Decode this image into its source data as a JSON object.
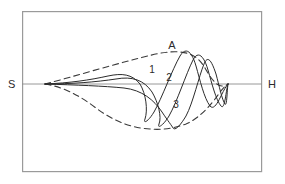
{
  "figure": {
    "title": "",
    "frame": {
      "x": 22,
      "y": 11,
      "width": 240,
      "height": 161,
      "stroke": "#9a9a9a",
      "stroke_width": 1.2
    },
    "baseline": {
      "y": 84,
      "x_start": 22,
      "x_end": 262,
      "stroke": "#8c8c8c",
      "stroke_width": 0.9
    },
    "colors": {
      "curve": "#2b2b2b",
      "envelope": "#3a3a3a",
      "axis": "#8c8c8c",
      "frame": "#9a9a9a",
      "background": "#ffffff",
      "text": "#2b2b2b"
    },
    "labels": {
      "left_axis": "S",
      "right_axis": "H",
      "apex": "A",
      "curve_1": "1",
      "curve_2": "2",
      "curve_3": "3"
    },
    "label_positions": {
      "left_axis": {
        "x": 8,
        "y": 88
      },
      "right_axis": {
        "x": 268,
        "y": 88
      },
      "apex": {
        "x": 172,
        "y": 49
      },
      "curve_1": {
        "x": 152,
        "y": 73
      },
      "curve_2": {
        "x": 169,
        "y": 81
      },
      "curve_3": {
        "x": 176,
        "y": 108
      }
    },
    "origin_point": {
      "x": 45,
      "y": 84
    },
    "convergence_point": {
      "x": 228,
      "y": 84
    },
    "envelope_upper_apex": {
      "x": 178,
      "y": 52
    },
    "envelope_lower_min": {
      "x": 168,
      "y": 129
    },
    "curves": [
      {
        "name": "curve-1",
        "label": "1",
        "dashed": false,
        "peak": {
          "x": 180,
          "y": 54
        },
        "trough": {
          "x": 143,
          "y": 119
        },
        "path": "M45,84 C70,83 90,80 108,76 C122,73 132,74 140,84 C146,94 148,110 145,119 C143,124 148,122 154,112 C162,98 172,70 180,56 C186,46 192,52 196,66 C200,80 204,98 210,106 C216,113 222,90 228,84"
      },
      {
        "name": "curve-2",
        "label": "2",
        "dashed": false,
        "peak": {
          "x": 192,
          "y": 58
        },
        "trough": {
          "x": 158,
          "y": 124
        },
        "path": "M45,84 C72,84 96,82 116,79 C132,76 144,80 152,92 C158,102 162,117 159,124 C157,129 163,126 169,116 C177,102 186,74 193,60 C198,50 204,56 208,70 C212,84 216,100 221,106 C225,111 226,89 228,84"
      },
      {
        "name": "curve-3",
        "label": "3",
        "dashed": false,
        "peak": {
          "x": 200,
          "y": 62
        },
        "trough": {
          "x": 172,
          "y": 128
        },
        "path": "M45,84 C76,85 104,86 124,88 C142,90 154,100 162,112 C168,121 172,126 173,128 C175,131 180,126 186,116 C193,103 199,76 204,64 C208,54 212,62 216,74 C219,85 222,100 225,104 C227,107 227,90 228,84"
      }
    ],
    "envelopes": [
      {
        "name": "envelope-upper",
        "dashed": true,
        "dash_pattern": "6,4",
        "path": "M45,84 C72,77 108,66 140,58 C158,53 170,51 180,52 C192,53 199,58 205,68 C210,77 216,86 222,86 C225,86 227,85 228,84"
      },
      {
        "name": "envelope-lower",
        "dashed": true,
        "dash_pattern": "6,4",
        "path": "M45,84 C64,87 80,96 96,108 C112,120 130,128 150,129 C160,130 172,129 186,124 C200,118 212,104 220,92 C224,87 226,85 228,84"
      }
    ]
  }
}
